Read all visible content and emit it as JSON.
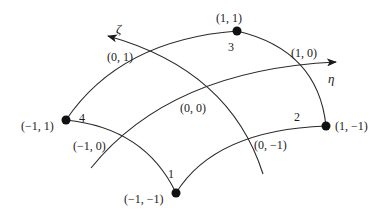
{
  "diagram": {
    "type": "curvilinear quadrilateral element in natural coordinates",
    "axes": {
      "zeta": {
        "label": "ζ"
      },
      "eta": {
        "label": "η"
      }
    },
    "nodes": [
      {
        "number": "1",
        "coord": "(−1, −1)"
      },
      {
        "number": "2",
        "coord": "(1, −1)"
      },
      {
        "number": "3",
        "coord": "(1, 1)"
      },
      {
        "number": "4",
        "coord": "(−1, 1)"
      }
    ],
    "midpoints": [
      {
        "coord": "(0, 1)"
      },
      {
        "coord": "(1, 0)"
      },
      {
        "coord": "(0, 0)"
      },
      {
        "coord": "(−1, 0)"
      },
      {
        "coord": "(0, −1)"
      }
    ],
    "colors": {
      "line": "#2a2a2a",
      "node": "#111111",
      "background": "#ffffff"
    }
  }
}
